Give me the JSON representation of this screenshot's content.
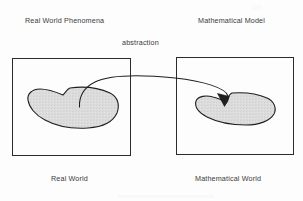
{
  "diagram": {
    "title_top_left": "Real World Phenomena",
    "title_top_right": "Mathematical Model",
    "arrow_label": "abstraction",
    "caption_bottom_left": "Real World",
    "caption_bottom_right": "Mathematical World",
    "colors": {
      "background": "#fdfdfd",
      "stroke": "#2b2b2b",
      "blob_fill": "#dcdcdc",
      "blob_stroke": "#1f1f1f",
      "text": "#3a3a3a"
    },
    "boxes": [
      {
        "name": "real-world-box",
        "x": 12,
        "y": 58,
        "width": 119,
        "height": 98
      },
      {
        "name": "mathematical-world-box",
        "x": 176,
        "y": 57,
        "width": 118,
        "height": 98
      }
    ],
    "blobs": [
      {
        "name": "real-world-phenomena-blob",
        "x": 28,
        "y": 87,
        "width": 90,
        "height": 41
      },
      {
        "name": "mathematical-model-blob",
        "x": 195,
        "y": 93,
        "width": 80,
        "height": 32
      }
    ],
    "arrow": {
      "name": "abstraction-arrow",
      "start_x": 80,
      "start_y": 106,
      "apex_y": 77,
      "end_x": 224,
      "end_y": 105,
      "direction": "left-to-right"
    }
  }
}
